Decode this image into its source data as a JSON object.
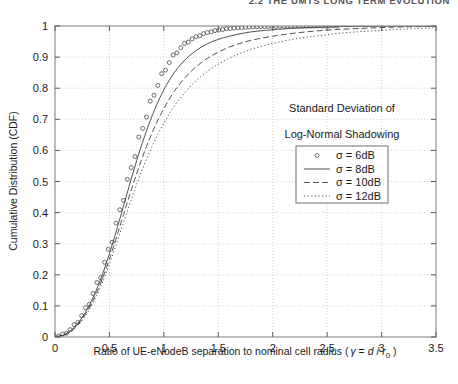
{
  "page_header": "2.2  THE UMTS LONG TERM EVOLUTION",
  "figure": {
    "xlabel_main": "Ratio of UE-eNodeB separation to nominal cell radius (",
    "xlabel_gamma": "γ",
    "xlabel_eq": " = ",
    "xlabel_d": "d",
    "xlabel_slash": " / ",
    "xlabel_r": "r",
    "xlabel_sub": "0",
    "xlabel_close": " )",
    "ylabel": "Cumulative Distribution (CDF)",
    "annotation_line1": "Standard Deviation of",
    "annotation_line2": "Log-Normal Shadowing",
    "xticks": [
      "0",
      "0.5",
      "1",
      "1.5",
      "2",
      "2.5",
      "3",
      "3.5"
    ],
    "yticks": [
      "0",
      "0.1",
      "0.2",
      "0.3",
      "0.4",
      "0.5",
      "0.6",
      "0.7",
      "0.8",
      "0.9",
      "1"
    ],
    "legend": [
      {
        "label": "σ = 6dB",
        "style": "circles"
      },
      {
        "label": "σ = 8dB",
        "style": "solid"
      },
      {
        "label": "σ = 10dB",
        "style": "dashed"
      },
      {
        "label": "σ = 12dB",
        "style": "dotted"
      }
    ]
  },
  "chart_data": {
    "type": "line",
    "title": "",
    "xlabel": "Ratio of UE-eNodeB separation to nominal cell radius ( γ = d / r0 )",
    "ylabel": "Cumulative Distribution (CDF)",
    "xlim": [
      0,
      3.5
    ],
    "ylim": [
      0,
      1
    ],
    "xticks": [
      0,
      0.5,
      1,
      1.5,
      2,
      2.5,
      3,
      3.5
    ],
    "yticks": [
      0,
      0.1,
      0.2,
      0.3,
      0.4,
      0.5,
      0.6,
      0.7,
      0.8,
      0.9,
      1
    ],
    "grid": true,
    "legend_position": "center-right",
    "legend_title": "Standard Deviation of Log-Normal Shadowing",
    "x": [
      0,
      0.1,
      0.2,
      0.3,
      0.4,
      0.5,
      0.6,
      0.7,
      0.8,
      0.9,
      1.0,
      1.1,
      1.2,
      1.3,
      1.4,
      1.5,
      1.6,
      1.7,
      1.8,
      1.9,
      2.0,
      2.2,
      2.4,
      2.6,
      2.8,
      3.0,
      3.2,
      3.5
    ],
    "series": [
      {
        "name": "σ = 6dB",
        "marker": "circle",
        "linestyle": "none",
        "values": [
          0.0,
          0.012,
          0.045,
          0.1,
          0.18,
          0.285,
          0.41,
          0.545,
          0.67,
          0.775,
          0.855,
          0.91,
          0.945,
          0.966,
          0.979,
          0.987,
          0.992,
          0.995,
          0.997,
          0.998,
          0.999,
          0.9995,
          0.9998,
          1.0,
          null,
          null,
          null,
          null
        ]
      },
      {
        "name": "σ = 8dB",
        "marker": "none",
        "linestyle": "solid",
        "values": [
          0.0,
          0.01,
          0.04,
          0.092,
          0.168,
          0.268,
          0.385,
          0.508,
          0.622,
          0.718,
          0.795,
          0.852,
          0.893,
          0.922,
          0.943,
          0.957,
          0.967,
          0.975,
          0.981,
          0.985,
          0.988,
          0.993,
          0.996,
          0.998,
          0.9988,
          0.9993,
          0.9996,
          1.0
        ]
      },
      {
        "name": "σ = 10dB",
        "marker": "none",
        "linestyle": "dashed",
        "values": [
          0.0,
          0.009,
          0.036,
          0.085,
          0.156,
          0.25,
          0.36,
          0.472,
          0.575,
          0.663,
          0.735,
          0.792,
          0.836,
          0.87,
          0.896,
          0.916,
          0.932,
          0.944,
          0.954,
          0.961,
          0.967,
          0.977,
          0.984,
          0.989,
          0.992,
          0.995,
          0.997,
          0.999
        ]
      },
      {
        "name": "σ = 12dB",
        "marker": "none",
        "linestyle": "dotted",
        "values": [
          0.0,
          0.008,
          0.033,
          0.079,
          0.146,
          0.234,
          0.337,
          0.441,
          0.537,
          0.619,
          0.688,
          0.744,
          0.789,
          0.825,
          0.854,
          0.877,
          0.896,
          0.912,
          0.925,
          0.935,
          0.944,
          0.958,
          0.968,
          0.976,
          0.982,
          0.986,
          0.99,
          0.994
        ]
      }
    ]
  }
}
